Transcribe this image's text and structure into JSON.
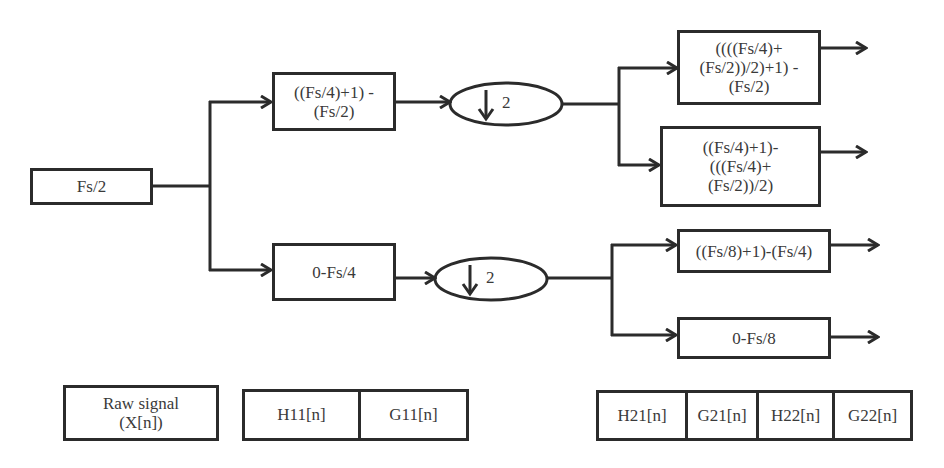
{
  "diagram": {
    "type": "wavelet-packet-decomposition",
    "root": {
      "label": "Fs/2"
    },
    "level1": {
      "high": {
        "lines": [
          "((Fs/4)+1) -",
          "(Fs/2)"
        ]
      },
      "low": {
        "lines": [
          "0-Fs/4"
        ]
      },
      "downsample_top": {
        "factor": "2",
        "icon": "down-arrow-icon"
      },
      "downsample_bottom": {
        "factor": "2",
        "icon": "down-arrow-icon"
      }
    },
    "level2": {
      "hh": {
        "lines": [
          "((((Fs/4)+",
          "(Fs/2))/2)+1) -",
          "(Fs/2)"
        ]
      },
      "hl": {
        "lines": [
          "((Fs/4)+1)-",
          "(((Fs/4)+",
          "(Fs/2))/2)"
        ]
      },
      "lh": {
        "lines": [
          "((Fs/8)+1)-(Fs/4)"
        ]
      },
      "ll": {
        "lines": [
          "0-Fs/8"
        ]
      }
    },
    "legend": {
      "raw": {
        "lines": [
          "Raw signal",
          "(X[n])"
        ]
      },
      "level1_cells": [
        "H11[n]",
        "G11[n]"
      ],
      "level2_cells": [
        "H21[n]",
        "G21[n]",
        "H22[n]",
        "G22[n]"
      ]
    },
    "colors": {
      "stroke": "#2b2b2b",
      "text": "#3a3a3a",
      "background": "#ffffff"
    }
  }
}
